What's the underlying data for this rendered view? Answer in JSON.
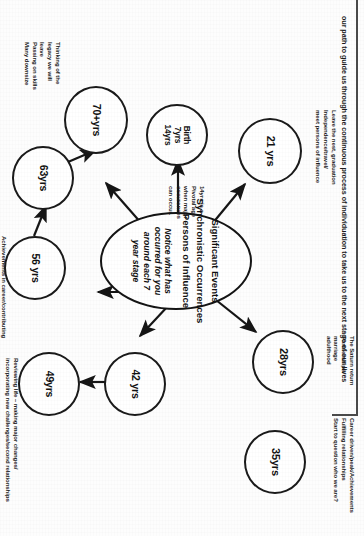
{
  "header": {
    "text": "our path to guide us through the continuous process of individuation to take us to the next stage of our lives"
  },
  "hub": {
    "line1": "Significant Events",
    "line2": "Synchronistic Occurrences",
    "line3": "Persons of Influence",
    "italic": "Notice what has occurred for you around each 7 year stage"
  },
  "nodes": [
    {
      "id": "birth",
      "label": "Birth\n7yrs\n14yrs"
    },
    {
      "id": "n21",
      "label": "21 yrs"
    },
    {
      "id": "n28",
      "label": "28yrs"
    },
    {
      "id": "n35",
      "label": "35yrs"
    },
    {
      "id": "n42",
      "label": "42 yrs"
    },
    {
      "id": "n49",
      "label": "49yrs"
    },
    {
      "id": "n56",
      "label": "56 yrs"
    },
    {
      "id": "n63",
      "label": "63yrs"
    },
    {
      "id": "n70",
      "label": "70+yrs"
    }
  ],
  "notes": {
    "birth": "14yrs is a\nPivotal age\nwhen major\noccurences\ncan occur.",
    "n21": "Leave the nest, graduation\nIndependence/travel/\nmeet persons of influence",
    "n28": "The Saturn return\nPartnerships/\nmarriage\nadulthood",
    "n35": "Career driven/peak/Achievements\nFulfilling relationships\nStart to question who we are?",
    "n49": "Reviewing life – making major changes/\nincorporating new challenges/second relationships",
    "n56": "Achievements in career/contributing\nto life/ giving back to\nsociety/continuing to develop\nMany retire early -or change this age to\npursue other careers that fits\nlifestyle",
    "n70": "Thinking of the\nlegacy we will\nleave\nPassing on skills\nMany downsize"
  },
  "colors": {
    "ink": "#1a1a1a",
    "paper": "#fdfdfd",
    "header_border": "#4a4a4a"
  }
}
